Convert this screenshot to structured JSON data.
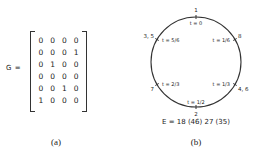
{
  "panel_a": {
    "label": "G =",
    "matrix": [
      [
        "0",
        "0",
        "0",
        "0"
      ],
      [
        "0",
        "0",
        "0",
        "1"
      ],
      [
        "0",
        "1",
        "0",
        "0"
      ],
      [
        "0",
        "0",
        "0",
        "0"
      ],
      [
        "0",
        "0",
        "1",
        "0"
      ],
      [
        "1",
        "0",
        "0",
        "0"
      ]
    ],
    "caption": "(a)"
  },
  "panel_b": {
    "points": [
      {
        "node": "1",
        "t": "t = 0"
      },
      {
        "node": "8",
        "t": "t = 1/6"
      },
      {
        "node": "4, 6",
        "t": "t = 1/3"
      },
      {
        "node": "2",
        "t": "t = 1/2"
      },
      {
        "node": "7",
        "t": "t = 2/3"
      },
      {
        "node": "3, 5",
        "t": "t = 5/6"
      }
    ],
    "equation": "E = 18 (46) 27 (35)",
    "caption": "(b)"
  }
}
